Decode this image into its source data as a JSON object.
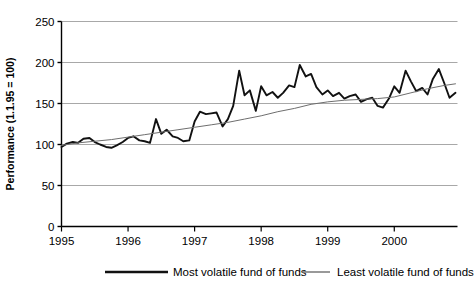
{
  "chart_data": {
    "type": "line",
    "title": "",
    "xlabel": "",
    "ylabel": "Performance (1.1.95 = 100)",
    "xlim": [
      1995.0,
      2000.95
    ],
    "ylim": [
      0,
      250
    ],
    "yticks": [
      0,
      50,
      100,
      150,
      200,
      250
    ],
    "ytick_labels": [
      "0",
      "50",
      "100",
      "150",
      "200",
      "250"
    ],
    "xticks": [
      1995,
      1996,
      1997,
      1998,
      1999,
      2000
    ],
    "xtick_labels": [
      "1995",
      "1996",
      "1997",
      "1998",
      "1999",
      "2000"
    ],
    "grid": "horizontal",
    "legend_position": "bottom",
    "series": [
      {
        "name": "Most volatile fund of funds",
        "color": "#111111",
        "width": 1.9,
        "x": [
          1995.0,
          1995.08,
          1995.17,
          1995.25,
          1995.33,
          1995.42,
          1995.5,
          1995.58,
          1995.67,
          1995.75,
          1995.83,
          1995.92,
          1996.0,
          1996.08,
          1996.17,
          1996.25,
          1996.33,
          1996.42,
          1996.5,
          1996.58,
          1996.67,
          1996.75,
          1996.83,
          1996.92,
          1997.0,
          1997.08,
          1997.17,
          1997.25,
          1997.33,
          1997.42,
          1997.5,
          1997.58,
          1997.67,
          1997.75,
          1997.83,
          1997.92,
          1998.0,
          1998.08,
          1998.17,
          1998.25,
          1998.33,
          1998.42,
          1998.5,
          1998.58,
          1998.67,
          1998.75,
          1998.83,
          1998.92,
          1999.0,
          1999.08,
          1999.17,
          1999.25,
          1999.33,
          1999.42,
          1999.5,
          1999.58,
          1999.67,
          1999.75,
          1999.83,
          1999.92,
          2000.0,
          2000.08,
          2000.17,
          2000.25,
          2000.33,
          2000.42,
          2000.5,
          2000.58,
          2000.67,
          2000.75,
          2000.83,
          2000.92
        ],
        "y": [
          97,
          101,
          103,
          102,
          107,
          108,
          103,
          100,
          97,
          96,
          99,
          103,
          108,
          110,
          105,
          104,
          102,
          131,
          113,
          118,
          110,
          108,
          104,
          105,
          128,
          140,
          137,
          138,
          139,
          122,
          131,
          147,
          190,
          160,
          166,
          141,
          171,
          160,
          164,
          157,
          163,
          172,
          170,
          197,
          183,
          186,
          170,
          161,
          166,
          159,
          163,
          156,
          159,
          161,
          152,
          155,
          157,
          147,
          145,
          156,
          171,
          163,
          190,
          177,
          165,
          169,
          161,
          180,
          192,
          175,
          157,
          163
        ]
      },
      {
        "name": "Least volatile fund of funds",
        "color": "#6e6e6e",
        "width": 1.0,
        "x": [
          1995.0,
          1995.25,
          1995.5,
          1995.75,
          1996.0,
          1996.25,
          1996.5,
          1996.75,
          1997.0,
          1997.25,
          1997.5,
          1997.75,
          1998.0,
          1998.25,
          1998.5,
          1998.75,
          1999.0,
          1999.25,
          1999.5,
          1999.75,
          2000.0,
          2000.25,
          2000.5,
          2000.75,
          2000.92
        ],
        "y": [
          99,
          102,
          104,
          106,
          109,
          112,
          115,
          118,
          121,
          124,
          127,
          131,
          135,
          140,
          144,
          149,
          152,
          154,
          155,
          156,
          158,
          163,
          168,
          172,
          174
        ]
      }
    ]
  },
  "legend": {
    "items": [
      {
        "label": "Most volatile fund of funds"
      },
      {
        "label": "Least volatile fund of funds"
      }
    ]
  }
}
